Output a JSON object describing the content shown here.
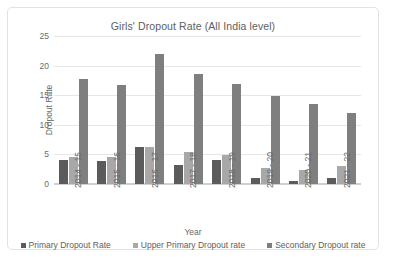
{
  "chart_data": {
    "type": "bar",
    "title": "Girls' Dropout Rate (All India level)",
    "xlabel": "Year",
    "ylabel": "Dropout Rate",
    "ylim": [
      0,
      25
    ],
    "yticks": [
      0,
      5,
      10,
      15,
      20,
      25
    ],
    "grid": true,
    "legend_position": "bottom",
    "categories": [
      "2014 - 15",
      "2015 - 16",
      "2016 - 17",
      "2017 - 18",
      "2018 - 19",
      "2019 - 20",
      "2020 - 21",
      "2021 - 22"
    ],
    "series": [
      {
        "name": "Primary Dropout Rate",
        "color": "#5b5b5b",
        "values": [
          4.1,
          3.9,
          6.2,
          3.2,
          4.1,
          1.0,
          0.5,
          1.1
        ]
      },
      {
        "name": "Upper Primary Dropout rate",
        "color": "#a8a8a8",
        "values": [
          4.5,
          4.6,
          6.3,
          5.4,
          4.9,
          2.7,
          2.4,
          3.0
        ]
      },
      {
        "name": "Secondary Dropout  rate",
        "color": "#7f7f7f",
        "values": [
          17.8,
          16.8,
          22.0,
          18.5,
          16.9,
          14.9,
          13.5,
          12.0
        ]
      }
    ]
  }
}
